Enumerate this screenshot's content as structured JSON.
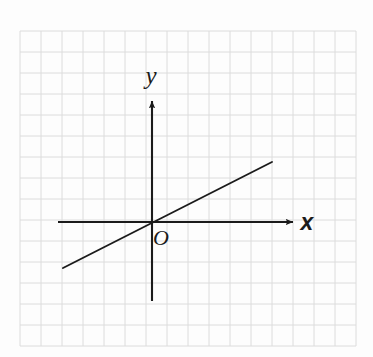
{
  "figure": {
    "kind": "coordinate-plane-line-graph",
    "background_color": "#fdfdfd",
    "grid": {
      "color": "#dcdcdc",
      "cell_size_px": 21,
      "left_px": 20,
      "top_px": 31,
      "right_px": 356,
      "bottom_px": 346,
      "columns": 16,
      "rows": 15,
      "visible": true
    },
    "axes": {
      "color": "#1b1b1b",
      "origin_px": {
        "x": 152,
        "y": 222
      },
      "x_axis": {
        "label": "x",
        "start_px": {
          "x": 58,
          "y": 222
        },
        "end_px": {
          "x": 293,
          "y": 222
        },
        "arrow": "right",
        "label_px": {
          "x": 307,
          "y": 230
        }
      },
      "y_axis": {
        "label": "y",
        "start_px": {
          "x": 152,
          "y": 301
        },
        "end_px": {
          "x": 152,
          "y": 101
        },
        "arrow": "up",
        "label_px": {
          "x": 151,
          "y": 84
        }
      },
      "origin_label": {
        "text": "O",
        "label_px": {
          "x": 161,
          "y": 245
        }
      }
    },
    "plot_line": {
      "color": "#1b1b1b",
      "start_px": {
        "x": 63,
        "y": 268
      },
      "end_px": {
        "x": 272,
        "y": 162
      },
      "passes_through_origin": true,
      "slope": 0.507,
      "y_intercept": 0
    }
  },
  "chart_data": {
    "type": "line",
    "title": "",
    "xlabel": "x",
    "ylabel": "y",
    "origin_label": "O",
    "grid": true,
    "legend": "none",
    "xlim": [
      -4.2,
      6.7
    ],
    "ylim": [
      -3.8,
      5.8
    ],
    "series": [
      {
        "name": "line through origin",
        "equation": "y = 0.5x",
        "slope": 0.5,
        "intercept": 0,
        "x": [
          -4.2,
          0,
          5.7
        ],
        "values": [
          -2.1,
          0,
          2.85
        ]
      }
    ]
  }
}
